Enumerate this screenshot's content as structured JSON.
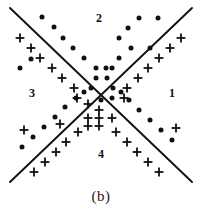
{
  "figure": {
    "caption": "(b)",
    "background_color": "#ffffff",
    "ink_color": "#111111",
    "width": 202,
    "height": 220
  },
  "quadrant_labels": [
    {
      "name": "region-1",
      "text": "1",
      "x": 172,
      "y": 97
    },
    {
      "name": "region-2",
      "text": "2",
      "x": 99,
      "y": 22
    },
    {
      "name": "region-3",
      "text": "3",
      "x": 32,
      "y": 97
    },
    {
      "name": "region-4",
      "text": "4",
      "x": 101,
      "y": 158
    }
  ],
  "chart_data": {
    "type": "scatter",
    "title": "",
    "subtitle": "(b)",
    "xlabel": "",
    "ylabel": "",
    "grid": false,
    "legend": "none",
    "axis_visible": false,
    "xlim": [
      0,
      202
    ],
    "ylim": [
      0,
      190
    ],
    "annotations": [
      "1",
      "2",
      "3",
      "4",
      "(b)"
    ],
    "decision_boundaries": [
      {
        "name": "boundary-down-right",
        "x1": 10,
        "y1": 8,
        "x2": 192,
        "y2": 182
      },
      {
        "name": "boundary-up-right",
        "x1": 10,
        "y1": 182,
        "x2": 192,
        "y2": 8
      }
    ],
    "series": [
      {
        "name": "class-dot",
        "marker": "dot",
        "color": "#111111",
        "count": 36,
        "points": [
          [
            42,
            17
          ],
          [
            54,
            27
          ],
          [
            63,
            38
          ],
          [
            73,
            48
          ],
          [
            84,
            58
          ],
          [
            96,
            68
          ],
          [
            96,
            78
          ],
          [
            106,
            68
          ],
          [
            107,
            78
          ],
          [
            91,
            88
          ],
          [
            84,
            92
          ],
          [
            76,
            98
          ],
          [
            65,
            107
          ],
          [
            55,
            117
          ],
          [
            44,
            127
          ],
          [
            33,
            137
          ],
          [
            22,
            147
          ],
          [
            119,
            38
          ],
          [
            128,
            28
          ],
          [
            139,
            18
          ],
          [
            131,
            48
          ],
          [
            119,
            58
          ],
          [
            112,
            68
          ],
          [
            113,
            88
          ],
          [
            121,
            92
          ],
          [
            129,
            100
          ],
          [
            139,
            110
          ],
          [
            150,
            120
          ],
          [
            161,
            130
          ],
          [
            172,
            140
          ],
          [
            158,
            18
          ],
          [
            150,
            48
          ],
          [
            31,
            59
          ],
          [
            20,
            68
          ],
          [
            101,
            100
          ],
          [
            112,
            98
          ]
        ]
      },
      {
        "name": "class-plus",
        "marker": "plus",
        "color": "#111111",
        "count": 34,
        "points": [
          [
            20,
            38
          ],
          [
            31,
            48
          ],
          [
            40,
            58
          ],
          [
            52,
            68
          ],
          [
            62,
            78
          ],
          [
            74,
            88
          ],
          [
            77,
            98
          ],
          [
            88,
            104
          ],
          [
            99,
            110
          ],
          [
            88,
            118
          ],
          [
            99,
            118
          ],
          [
            88,
            126
          ],
          [
            99,
            126
          ],
          [
            78,
            132
          ],
          [
            66,
            142
          ],
          [
            56,
            152
          ],
          [
            45,
            162
          ],
          [
            34,
            172
          ],
          [
            181,
            38
          ],
          [
            170,
            48
          ],
          [
            159,
            58
          ],
          [
            148,
            68
          ],
          [
            138,
            78
          ],
          [
            127,
            88
          ],
          [
            124,
            98
          ],
          [
            116,
            132
          ],
          [
            127,
            142
          ],
          [
            137,
            152
          ],
          [
            148,
            162
          ],
          [
            159,
            172
          ],
          [
            24,
            130
          ],
          [
            60,
            124
          ],
          [
            112,
            118
          ],
          [
            176,
            128
          ]
        ]
      }
    ]
  }
}
